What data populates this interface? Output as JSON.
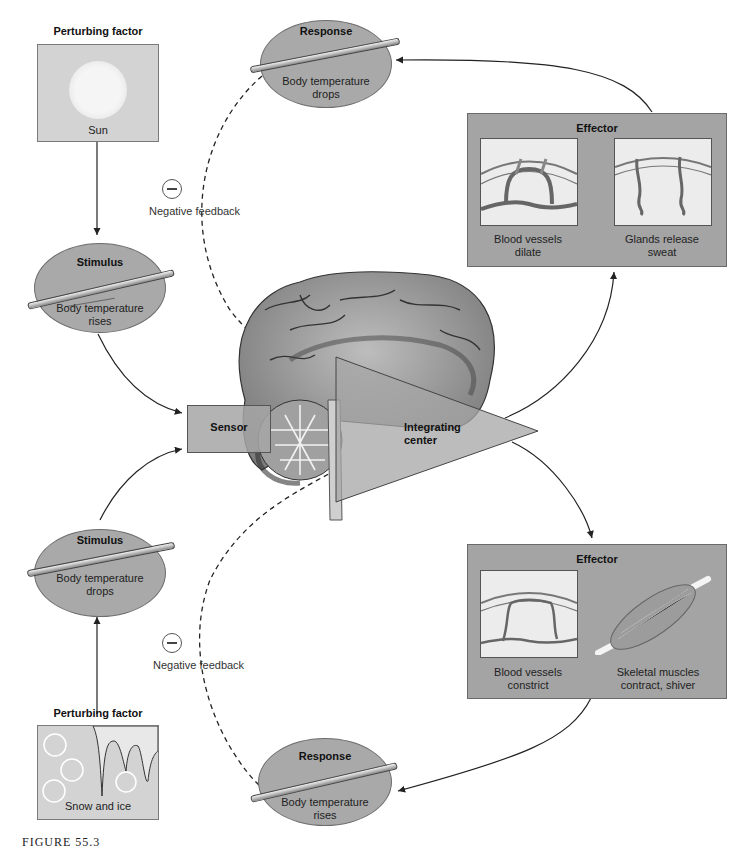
{
  "top_half": {
    "perturbing_factor": {
      "title": "Perturbing factor",
      "label": "Sun"
    },
    "stimulus": {
      "title": "Stimulus",
      "text_line1": "Body temperature",
      "text_line2": "rises"
    },
    "response": {
      "title": "Response",
      "text_line1": "Body temperature",
      "text_line2": "drops"
    },
    "negative_feedback": "Negative feedback",
    "effector": {
      "title": "Effector",
      "panels": [
        {
          "line1": "Blood vessels",
          "line2": "dilate"
        },
        {
          "line1": "Glands release",
          "line2": "sweat"
        }
      ]
    }
  },
  "center": {
    "sensor": "Sensor",
    "integrating_center_line1": "Integrating",
    "integrating_center_line2": "center"
  },
  "bottom_half": {
    "perturbing_factor": {
      "title": "Perturbing factor",
      "label": "Snow and ice"
    },
    "stimulus": {
      "title": "Stimulus",
      "text_line1": "Body temperature",
      "text_line2": "drops"
    },
    "response": {
      "title": "Response",
      "text_line1": "Body temperature",
      "text_line2": "rises"
    },
    "negative_feedback": "Negative feedback",
    "effector": {
      "title": "Effector",
      "panels": [
        {
          "line1": "Blood vessels",
          "line2": "constrict"
        },
        {
          "line1": "Skeletal muscles",
          "line2": "contract, shiver"
        }
      ]
    }
  },
  "caption": "FIGURE 55.3"
}
